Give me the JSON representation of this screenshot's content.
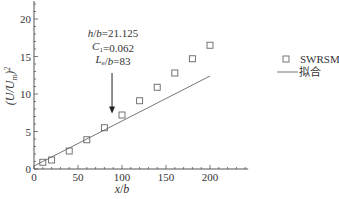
{
  "chart_data": {
    "type": "scatter",
    "title": "",
    "xlabel": "x/b",
    "ylabel": "(U/U_m)^2",
    "xlim": [
      0,
      240
    ],
    "ylim": [
      0,
      22
    ],
    "xticks": [
      0,
      50,
      100,
      150,
      200
    ],
    "yticks": [
      0,
      5,
      10,
      15,
      20
    ],
    "grid": false,
    "legend_position": "right",
    "series": [
      {
        "name": "SWRSM",
        "kind": "scatter",
        "marker": "square-open",
        "x": [
          10,
          20,
          40,
          60,
          80,
          100,
          120,
          140,
          160,
          180,
          200
        ],
        "y": [
          0.9,
          1.2,
          2.4,
          3.9,
          5.5,
          7.2,
          9.1,
          10.9,
          12.8,
          14.7,
          16.5
        ]
      },
      {
        "name": "拟合",
        "kind": "line",
        "x": [
          0,
          200
        ],
        "y": [
          0.4,
          12.4
        ]
      }
    ],
    "annotations": [
      {
        "text_parts": [
          [
            "h",
            "i"
          ],
          [
            "/",
            ""
          ],
          [
            "b",
            "i"
          ],
          [
            "=21.125",
            ""
          ]
        ],
        "label": "h/b=21.125"
      },
      {
        "text_parts": [
          [
            "C",
            "i"
          ],
          [
            "1",
            "sub"
          ],
          [
            "=0.062",
            ""
          ]
        ],
        "label": "C1=0.062"
      },
      {
        "text_parts": [
          [
            "L",
            "i"
          ],
          [
            "e",
            "sub"
          ],
          [
            "/",
            ""
          ],
          [
            "b",
            "i"
          ],
          [
            "=83",
            ""
          ]
        ],
        "label": "Le/b=83"
      }
    ],
    "arrow": {
      "x": 83,
      "y_from": 12.8,
      "y_to": 7.4
    }
  },
  "legend": {
    "items": [
      {
        "label": "SWRSM",
        "symbol": "square"
      },
      {
        "label": "拟合",
        "symbol": "line"
      }
    ]
  },
  "axes": {
    "x_label_main": "x",
    "x_label_sep": "/",
    "x_label_den": "b",
    "y_label": "(U/U",
    "y_label_sub": "m",
    "y_label_end": ")",
    "y_label_sup": "2"
  },
  "colors": {
    "axis": "#555555",
    "marker": "#666666",
    "line": "#777777",
    "text": "#333333"
  }
}
